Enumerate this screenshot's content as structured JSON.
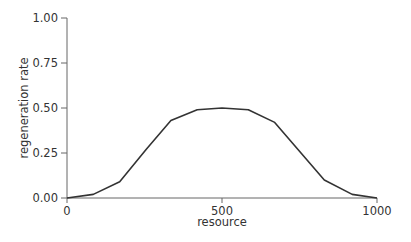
{
  "chart_data": {
    "type": "line",
    "title": "",
    "xlabel": "resource",
    "ylabel": "regeneration rate",
    "xlim": [
      0,
      1000
    ],
    "ylim": [
      0,
      1.0
    ],
    "xticks": [
      0,
      500,
      1000
    ],
    "xtick_labels": [
      "0",
      "500",
      "1000"
    ],
    "yticks": [
      0,
      0.25,
      0.5,
      0.75,
      1.0
    ],
    "ytick_labels": [
      "0.00",
      "0.25",
      "0.50",
      "0.75",
      "1.00"
    ],
    "grid": false,
    "legend": null,
    "series": [
      {
        "name": "regeneration rate",
        "color": "#333333",
        "x": [
          0,
          85,
          170,
          255,
          335,
          420,
          500,
          585,
          670,
          830,
          920,
          1000
        ],
        "y": [
          0.0,
          0.02,
          0.09,
          0.27,
          0.43,
          0.49,
          0.5,
          0.49,
          0.42,
          0.1,
          0.02,
          0.0
        ]
      }
    ]
  },
  "colors": {
    "line": "#333333",
    "axis": "#666666",
    "text": "#333333"
  }
}
